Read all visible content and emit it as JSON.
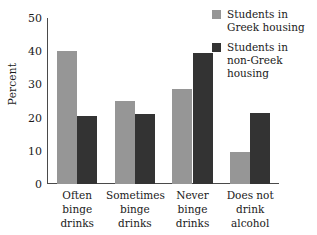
{
  "chart_data": {
    "type": "bar",
    "title": "",
    "xlabel": "",
    "ylabel": "Percent",
    "ylim": [
      0,
      50
    ],
    "yticks": [
      0,
      10,
      20,
      30,
      40,
      50
    ],
    "grid": false,
    "legend_position": "top-right",
    "categories": [
      "Often binge drinks",
      "Sometimes binge drinks",
      "Never binge drinks",
      "Does not drink alcohol"
    ],
    "category_lines": [
      [
        "Often",
        "binge",
        "drinks"
      ],
      [
        "Sometimes",
        "binge",
        "drinks"
      ],
      [
        "Never",
        "binge",
        "drinks"
      ],
      [
        "Does not",
        "drink",
        "alcohol"
      ]
    ],
    "series": [
      {
        "name": "Students in Greek housing",
        "name_lines": [
          "Students in",
          "Greek housing"
        ],
        "color": "#969696",
        "values": [
          40,
          25,
          28.5,
          9.5
        ]
      },
      {
        "name": "Students in non-Greek housing",
        "name_lines": [
          "Students in",
          "non-Greek",
          "housing"
        ],
        "color": "#333333",
        "values": [
          20.5,
          21,
          39.5,
          21.5
        ]
      }
    ]
  },
  "axis": {
    "line_color": "#4a4a4a"
  }
}
